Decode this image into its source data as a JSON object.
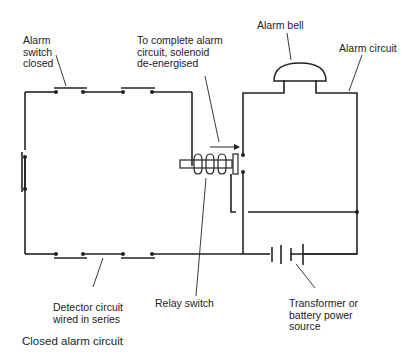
{
  "diagram": {
    "title": "Closed alarm circuit",
    "labels": {
      "alarm_switch": "Alarm\nswitch\nclosed",
      "solenoid_note": "To complete alarm\ncircuit, solenoid\nde-energised",
      "alarm_bell": "Alarm bell",
      "alarm_circuit": "Alarm circuit",
      "detector_circuit": "Detector circuit\nwired in series",
      "relay_switch": "Relay switch",
      "power_source": "Transformer or\nbattery power\nsource"
    },
    "components": [
      {
        "id": "detector-loop",
        "type": "closed series circuit",
        "switches": 5
      },
      {
        "id": "relay",
        "type": "solenoid relay switch",
        "state": "de-energised"
      },
      {
        "id": "bell",
        "type": "alarm bell"
      },
      {
        "id": "battery",
        "type": "power source"
      }
    ],
    "colors": {
      "line": "#222222",
      "background": "#ffffff"
    }
  }
}
